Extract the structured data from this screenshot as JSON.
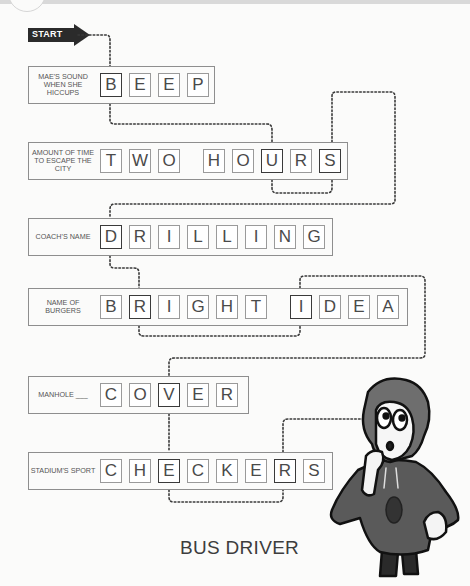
{
  "puzzle": {
    "start_label": "START",
    "answer_title": "BUS DRIVER",
    "rows": [
      {
        "clue": "MAE'S SOUND WHEN SHE HICCUPS",
        "letters": [
          "B",
          "E",
          "E",
          "P"
        ],
        "highlighted": [
          0
        ]
      },
      {
        "clue": "AMOUNT OF TIME TO ESCAPE THE CITY",
        "letters": [
          "T",
          "W",
          "O",
          " ",
          "H",
          "O",
          "U",
          "R",
          "S"
        ],
        "highlighted": [
          6,
          8
        ]
      },
      {
        "clue": "COACH'S NAME",
        "letters": [
          "D",
          "R",
          "I",
          "L",
          "L",
          "I",
          "N",
          "G"
        ],
        "highlighted": [
          0
        ]
      },
      {
        "clue": "NAME OF BURGERS",
        "letters": [
          "B",
          "R",
          "I",
          "G",
          "H",
          "T",
          " ",
          "I",
          "D",
          "E",
          "A"
        ],
        "highlighted": [
          1,
          7
        ]
      },
      {
        "clue": "MANHOLE ___",
        "letters": [
          "C",
          "O",
          "V",
          "E",
          "R"
        ],
        "highlighted": [
          2
        ]
      },
      {
        "clue": "STADIUM'S SPORT",
        "letters": [
          "C",
          "H",
          "E",
          "C",
          "K",
          "E",
          "R",
          "S"
        ],
        "highlighted": [
          2,
          6
        ]
      }
    ]
  },
  "colors": {
    "ink": "#2b2b2b",
    "tile_border": "#9a9a9a",
    "background": "#fbfbfa"
  },
  "icons": {
    "character": "character-illustration-icon",
    "start": "start-arrow-icon"
  }
}
